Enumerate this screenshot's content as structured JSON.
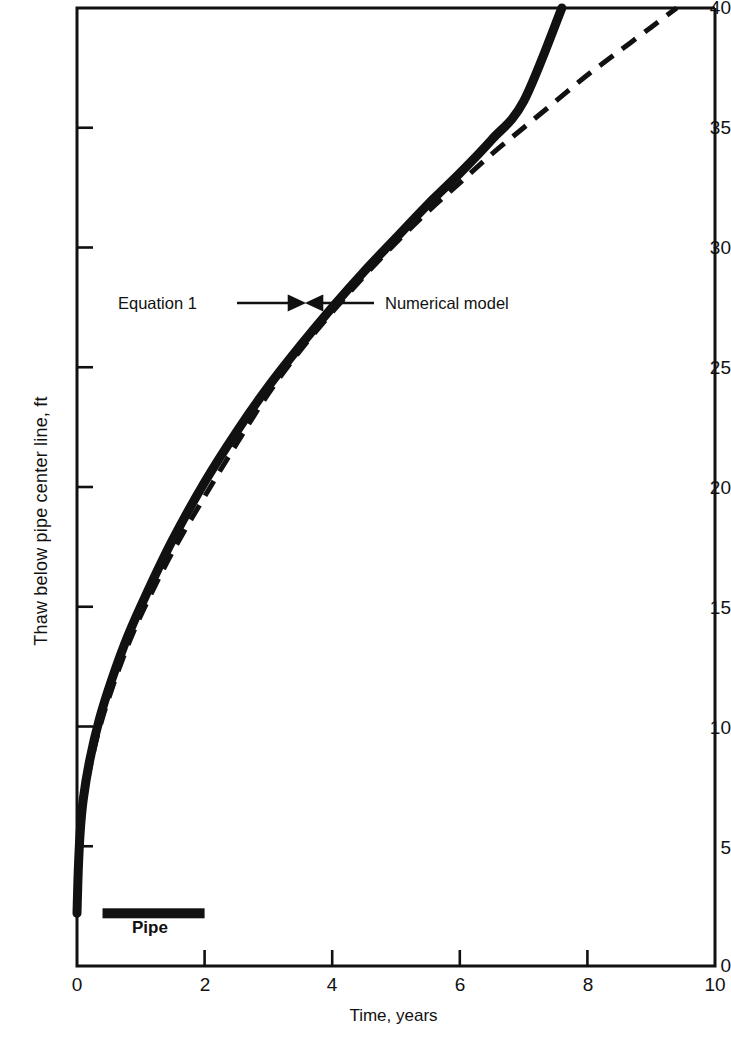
{
  "figure": {
    "kind": "line-chart",
    "background": "#ffffff",
    "ink_color": "#111111"
  },
  "chart_data": {
    "type": "line",
    "title": "",
    "xlabel": "Time, years",
    "ylabel": "Thaw below pipe center line, ft",
    "xlim": [
      0,
      10
    ],
    "ylim": [
      0,
      40
    ],
    "xticks": [
      0,
      2,
      4,
      6,
      8,
      10
    ],
    "xtick_labels": [
      "0",
      "2",
      "4",
      "6",
      "8",
      "10"
    ],
    "yticks": [
      0,
      5,
      10,
      15,
      20,
      25,
      30,
      35,
      40
    ],
    "ytick_labels": [
      "0",
      "5",
      "10",
      "15",
      "20",
      "25",
      "30",
      "35",
      "40"
    ],
    "grid": false,
    "legend": "annotations-with-arrows",
    "series": [
      {
        "name": "Equation 1",
        "style": "solid-thick",
        "linewidth_px": 9,
        "x": [
          0.0,
          0.02,
          0.05,
          0.1,
          0.2,
          0.35,
          0.55,
          0.8,
          1.1,
          1.5,
          2.0,
          2.5,
          3.0,
          3.5,
          4.0,
          4.5,
          5.0,
          5.5,
          6.0,
          6.5,
          7.0,
          7.6
        ],
        "y": [
          2.2,
          4.0,
          5.6,
          7.0,
          8.6,
          10.3,
          12.0,
          13.8,
          15.6,
          17.8,
          20.2,
          22.3,
          24.2,
          25.9,
          27.5,
          29.0,
          30.4,
          31.8,
          33.1,
          34.5,
          36.1,
          40.0
        ]
      },
      {
        "name": "Numerical model",
        "style": "dashed",
        "linewidth_px": 5,
        "dash_pattern": "17 11",
        "x": [
          0.05,
          0.15,
          0.3,
          0.5,
          0.8,
          1.1,
          1.5,
          2.0,
          2.5,
          3.0,
          3.5,
          4.0,
          4.5,
          5.0,
          5.5,
          6.0,
          6.5,
          7.0,
          7.5,
          8.0,
          8.5,
          9.0,
          9.4
        ],
        "y": [
          5.5,
          7.5,
          9.4,
          11.2,
          13.4,
          15.2,
          17.3,
          19.6,
          21.8,
          23.9,
          25.7,
          27.3,
          28.8,
          30.2,
          31.5,
          32.7,
          33.9,
          35.0,
          36.1,
          37.2,
          38.2,
          39.2,
          40.0
        ]
      }
    ],
    "markers": [
      {
        "name": "pipe",
        "label": "Pipe",
        "shape": "horizontal-bar",
        "x_start": 0.4,
        "x_end": 2.0,
        "y": 2.2
      }
    ],
    "annotations": [
      {
        "name": "equation-1",
        "text": "Equation 1",
        "arrow": "right",
        "points_to_series": "Equation 1",
        "x_text": 1.5,
        "y_text": 27.6
      },
      {
        "name": "numerical-model",
        "text": "Numerical model",
        "arrow": "left",
        "points_to_series": "Numerical model",
        "x_text": 4.6,
        "y_text": 27.6
      }
    ]
  },
  "axes": {
    "y_tick_labels": [
      {
        "value": "40",
        "px_y": 8
      },
      {
        "value": "35",
        "px_y": 128
      },
      {
        "value": "30",
        "px_y": 248
      },
      {
        "value": "25",
        "px_y": 368
      },
      {
        "value": "20",
        "px_y": 488
      },
      {
        "value": "15",
        "px_y": 608
      },
      {
        "value": "10",
        "px_y": 728
      },
      {
        "value": "5",
        "px_y": 848
      },
      {
        "value": "0",
        "px_y": 966
      }
    ],
    "x_tick_labels": [
      {
        "value": "0",
        "px_x": 77
      },
      {
        "value": "2",
        "px_x": 205
      },
      {
        "value": "4",
        "px_x": 332
      },
      {
        "value": "6",
        "px_x": 460
      },
      {
        "value": "8",
        "px_x": 588
      },
      {
        "value": "10",
        "px_x": 715
      }
    ]
  },
  "labels": {
    "x_axis_title": "Time, years",
    "y_axis_title": "Thaw below pipe center line, ft",
    "pipe_label": "Pipe",
    "equation_label": "Equation 1",
    "numerical_label": "Numerical model"
  }
}
